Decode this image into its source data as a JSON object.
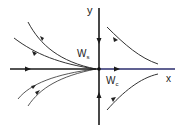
{
  "diagram": {
    "type": "phase-portrait",
    "labels": {
      "y_axis": "y",
      "x_axis": "x",
      "stable_manifold": "W",
      "stable_manifold_sub": "s",
      "center_manifold": "W",
      "center_manifold_sub": "c"
    },
    "colors": {
      "axis": "#1a1a1a",
      "center_manifold": "#2b2d6e",
      "trajectory": "#333333",
      "background": "#ffffff"
    },
    "origin": [
      99,
      69
    ],
    "trajectories": {
      "left_upper": 2,
      "left_lower": 2,
      "right_upper": 1,
      "right_lower": 1
    }
  }
}
